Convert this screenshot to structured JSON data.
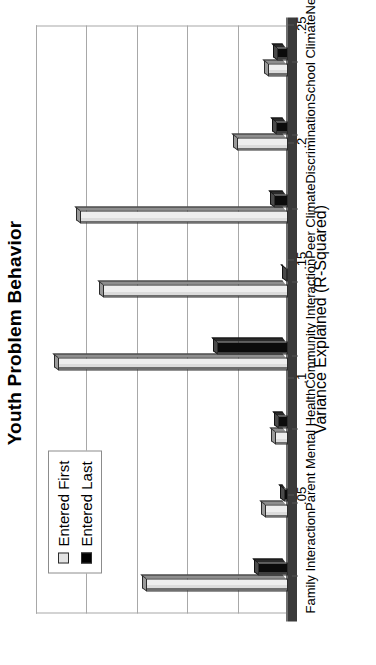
{
  "chart_data": {
    "type": "bar",
    "title": "Youth Problem Behavior",
    "xlabel": "",
    "ylabel": "Variance Explained (R-Squared)",
    "ylim": [
      0,
      0.25
    ],
    "yticks": [
      0.05,
      0.1,
      0.15,
      0.2,
      0.25
    ],
    "ytick_labels": [
      ".05",
      ".1",
      ".15",
      ".2",
      ".25"
    ],
    "grid": true,
    "legend_position": "top-left",
    "categories": [
      "Family Interaction",
      "Parent Mental Health",
      "Community Interaction",
      "Peer Climate",
      "Discrimination",
      "School Climate",
      "Neighborhood Quality",
      "Parent SES"
    ],
    "series": [
      {
        "name": "Entered First",
        "color": "#e3e3e3",
        "values": [
          0.141,
          0.023,
          0.013,
          0.228,
          0.184,
          0.206,
          0.051,
          0.02
        ]
      },
      {
        "name": "Entered Last",
        "color": "#000000",
        "values": [
          0.03,
          0.004,
          0.01,
          0.07,
          0.002,
          0.014,
          0.012,
          0.011
        ]
      }
    ]
  },
  "axis": {
    "tick_labels": [
      ".05",
      ".1",
      ".15",
      ".2",
      ".25"
    ],
    "title": "Variance Explained (R-Squared)"
  },
  "legend": {
    "items": [
      {
        "label": "Entered First",
        "swatch": "light-gray-square-icon"
      },
      {
        "label": "Entered Last",
        "swatch": "black-square-icon"
      }
    ]
  },
  "header": {
    "title": "Youth Problem Behavior"
  }
}
